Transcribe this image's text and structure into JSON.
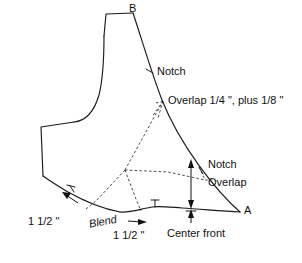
{
  "figure": {
    "type": "sewing-pattern-draft",
    "background_color": "#ffffff",
    "line_color": "#1a1a1a",
    "construction_line_style": "dashed"
  },
  "points": {
    "a_label": "A",
    "b_label": "B"
  },
  "annotations": {
    "notch_upper": "Notch",
    "overlap_upper": "Overlap 1/4 \", plus 1/8 \"",
    "notch_right": "Notch",
    "overlap_right": "Overlap",
    "blend_dim": "1 1/2 \"",
    "blend_word": "Blend",
    "hem_dim": "1 1/2 \"",
    "center_front": "Center front"
  },
  "geometry": {
    "outline_path": "M 103,34 L 105,13 L 133,12 L 152,72 L 182,104 L 240,212 L 196,209 L 155,206 L 118,212 L 72,196 L 46,181 L 38,167 L 41,126 L 73,122 L 82,112 L 92,89 L 99,60 Z",
    "point_a": [
      240,
      212
    ],
    "point_b": [
      133,
      12
    ],
    "dart_apex": [
      125,
      170
    ],
    "notch_upper_pos": [
      150,
      72
    ],
    "notch_right_pos": [
      203,
      178
    ],
    "notch_hem_pos": [
      155,
      206
    ],
    "notch_lower_left_pos": [
      72,
      192
    ]
  }
}
